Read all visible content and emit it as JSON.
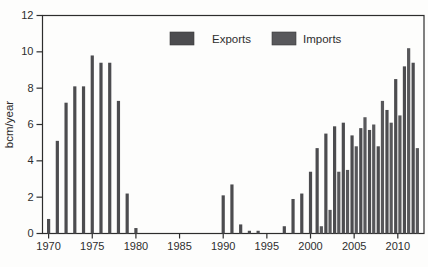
{
  "figure": {
    "ylabel": "bcm/year",
    "frame_color": "#2d2d2d",
    "background": "#fdfdfc",
    "text_color": "#2e2e2e"
  },
  "chart_data": {
    "type": "bar",
    "title": "",
    "xlabel": "",
    "ylabel": "bcm/year",
    "ylim": [
      0,
      12
    ],
    "yticks": [
      0,
      2,
      4,
      6,
      8,
      10,
      12
    ],
    "xticks": [
      1970,
      1975,
      1980,
      1985,
      1990,
      1995,
      2000,
      2005,
      2010
    ],
    "grid": false,
    "legend_position": "top-center-inside",
    "categories": [
      1970,
      1971,
      1972,
      1973,
      1974,
      1975,
      1976,
      1977,
      1978,
      1979,
      1980,
      1981,
      1982,
      1983,
      1984,
      1985,
      1986,
      1987,
      1988,
      1989,
      1990,
      1991,
      1992,
      1993,
      1994,
      1995,
      1996,
      1997,
      1998,
      1999,
      2000,
      2001,
      2002,
      2003,
      2004,
      2005,
      2006,
      2007,
      2008,
      2009,
      2010,
      2011,
      2012
    ],
    "series": [
      {
        "name": "Exports",
        "color": "#4c4c4f",
        "values": [
          0.8,
          5.1,
          7.2,
          8.1,
          8.1,
          9.8,
          9.4,
          9.4,
          7.3,
          2.2,
          0.3,
          0,
          0,
          0,
          0,
          0,
          0,
          0,
          0,
          0,
          2.1,
          2.7,
          0.5,
          0.15,
          0.15,
          0,
          0,
          0.4,
          1.9,
          2.2,
          3.4,
          4.7,
          5.5,
          5.9,
          6.1,
          5.4,
          5.8,
          5.7,
          4.8,
          6.8,
          8.5,
          9.2,
          9.4
        ]
      },
      {
        "name": "Imports",
        "color": "#58585b",
        "values": [
          0,
          0,
          0,
          0,
          0,
          0,
          0,
          0,
          0,
          0,
          0,
          0,
          0,
          0,
          0,
          0,
          0,
          0,
          0,
          0,
          0,
          0,
          0,
          0,
          0,
          0,
          0,
          0,
          0,
          0,
          0,
          0.4,
          1.3,
          3.4,
          3.5,
          4.8,
          6.4,
          6.0,
          7.3,
          6.1,
          6.5,
          10.2,
          4.7
        ]
      }
    ]
  }
}
